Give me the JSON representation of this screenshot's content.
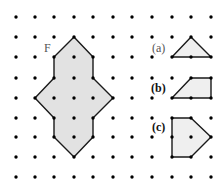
{
  "grid": {
    "columns_x": [
      16,
      35,
      54,
      74,
      93,
      113,
      132,
      152,
      172,
      191,
      211
    ],
    "rows_y": [
      17,
      37,
      57,
      78,
      98,
      118,
      137,
      157,
      177
    ],
    "dot_radius": 1.7,
    "dot_color": "#000000"
  },
  "shapes": [
    {
      "id": "F",
      "label": "F",
      "label_pos": [
        44,
        52
      ],
      "label_bold": false,
      "fill": "#e2e2e2",
      "points": [
        [
          74,
          37
        ],
        [
          93,
          57
        ],
        [
          93,
          78
        ],
        [
          113,
          98
        ],
        [
          93,
          118
        ],
        [
          93,
          137
        ],
        [
          74,
          157
        ],
        [
          54,
          137
        ],
        [
          54,
          118
        ],
        [
          35,
          98
        ],
        [
          54,
          78
        ],
        [
          54,
          57
        ]
      ]
    },
    {
      "id": "a",
      "label": "(a)",
      "label_pos": [
        152,
        52
      ],
      "label_bold": false,
      "fill": "#efefef",
      "points": [
        [
          191,
          37
        ],
        [
          211,
          57
        ],
        [
          172,
          57
        ]
      ]
    },
    {
      "id": "b",
      "label": "(b)",
      "label_pos": [
        151,
        92
      ],
      "label_bold": true,
      "fill": "#efefef",
      "points": [
        [
          191,
          78
        ],
        [
          211,
          78
        ],
        [
          211,
          98
        ],
        [
          172,
          98
        ]
      ]
    },
    {
      "id": "c",
      "label": "(c)",
      "label_pos": [
        152,
        131
      ],
      "label_bold": true,
      "fill": "#efefef",
      "points": [
        [
          172,
          118
        ],
        [
          191,
          118
        ],
        [
          211,
          137
        ],
        [
          191,
          157
        ],
        [
          172,
          157
        ]
      ]
    }
  ],
  "stroke_color": "#1a1a1a"
}
